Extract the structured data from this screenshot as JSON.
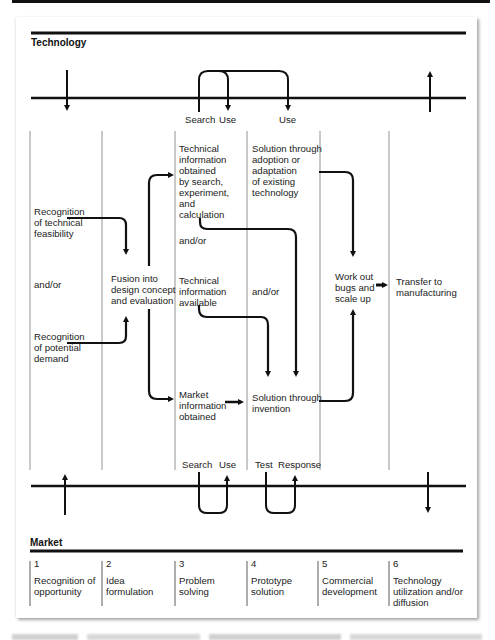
{
  "sections": {
    "technology": "Technology",
    "market": "Market"
  },
  "top_timeline": {
    "labels": {
      "search": "Search",
      "use1": "Use",
      "use2": "Use"
    }
  },
  "bottom_timeline": {
    "labels": {
      "search": "Search",
      "use": "Use",
      "test": "Test",
      "response": "Response"
    }
  },
  "nodes": {
    "tech_feasibility": [
      "Recognition",
      "of technical",
      "feasibility"
    ],
    "and_or_1": [
      "and/or"
    ],
    "potential_demand": [
      "Recognition",
      "of potential",
      "demand"
    ],
    "fusion": [
      "Fusion into",
      "design concept",
      "and evaluation"
    ],
    "tech_info_obtained": [
      "Technical",
      "information",
      "obtained",
      "by search,",
      "experiment,",
      "and",
      "calculation"
    ],
    "and_or_2": [
      "and/or"
    ],
    "tech_info_available": [
      "Technical",
      "information",
      "available"
    ],
    "market_info": [
      "Market",
      "information",
      "obtained"
    ],
    "adoption": [
      "Solution through",
      "adoption or",
      "adaptation",
      "of existing",
      "technology"
    ],
    "and_or_3": [
      "and/or"
    ],
    "invention": [
      "Solution through",
      "invention"
    ],
    "work_out": [
      "Work out",
      "bugs and",
      "scale up"
    ],
    "transfer": [
      "Transfer to",
      "manufacturing"
    ]
  },
  "stages": [
    {
      "num": "1",
      "label": [
        "Recognition of",
        "opportunity"
      ]
    },
    {
      "num": "2",
      "label": [
        "Idea",
        "formulation"
      ]
    },
    {
      "num": "3",
      "label": [
        "Problem",
        "solving"
      ]
    },
    {
      "num": "4",
      "label": [
        "Prototype",
        "solution"
      ]
    },
    {
      "num": "5",
      "label": [
        "Commercial",
        "development"
      ]
    },
    {
      "num": "6",
      "label": [
        "Technology",
        "utilization and/or",
        "diffusion"
      ]
    }
  ]
}
